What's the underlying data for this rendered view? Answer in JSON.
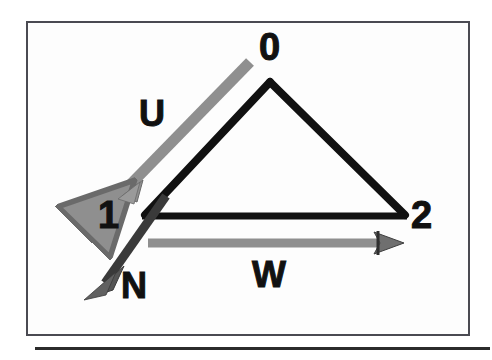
{
  "figure": {
    "background_color": "#ffffff",
    "frame_border_color": "#4a4a52",
    "frame_fill_color": "#fdfdfd",
    "triangle_color": "#111111",
    "vector_gray_color": "#8a8a8a",
    "vector_dark_gray_color": "#555555",
    "arrowhead_color": "#3a3a3a",
    "caption_rule_color": "#2b2b2b"
  },
  "nodes": [
    {
      "id": "node-0",
      "label": "0",
      "x": 270,
      "y": 82
    },
    {
      "id": "node-1",
      "label": "1",
      "x": 145,
      "y": 215
    },
    {
      "id": "node-2",
      "label": "2",
      "x": 405,
      "y": 215
    }
  ],
  "edges": [
    {
      "id": "edge-0-1",
      "from": "node-0",
      "to": "node-1"
    },
    {
      "id": "edge-0-2",
      "from": "node-0",
      "to": "node-2"
    },
    {
      "id": "edge-1-2",
      "from": "node-1",
      "to": "node-2"
    }
  ],
  "vectors": [
    {
      "id": "vector-u",
      "label": "U",
      "color": "#8a8a8a",
      "from_x": 250,
      "from_y": 62,
      "to_x": 120,
      "to_y": 196,
      "direction": "down-left"
    },
    {
      "id": "vector-v",
      "label": "N",
      "color": "#555555",
      "from_x": 160,
      "from_y": 200,
      "to_x": 92,
      "to_y": 297,
      "direction": "down-left"
    },
    {
      "id": "vector-w",
      "label": "W",
      "color": "#8a8a8a",
      "from_x": 148,
      "from_y": 243,
      "to_x": 402,
      "to_y": 243,
      "direction": "right"
    }
  ],
  "caption_rule": {
    "present": true
  }
}
